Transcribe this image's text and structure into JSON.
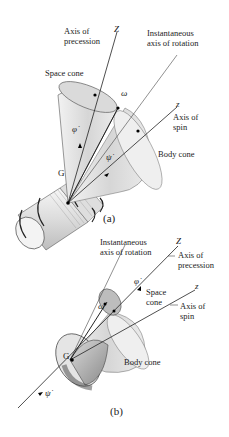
{
  "figure_a": {
    "caption": "(a)",
    "labels": {
      "axis_precession": "Axis of\nprecession",
      "axis_precession_l1": "Axis of",
      "axis_precession_l2": "precession",
      "Z": "Z",
      "inst_axis_l1": "Instantaneous",
      "inst_axis_l2": "axis of rotation",
      "space_cone": "Space cone",
      "omega": "ω",
      "z": "z",
      "axis_spin_l1": "Axis of",
      "axis_spin_l2": "spin",
      "phi_dot": "φ̇",
      "psi_dot": "ψ̇",
      "G": "G",
      "body_cone": "Body cone"
    }
  },
  "figure_b": {
    "caption": "(b)",
    "labels": {
      "inst_axis_l1": "Instantaneous",
      "inst_axis_l2": "axis of rotation",
      "Z": "Z",
      "axis_precession_l1": "Axis of",
      "axis_precession_l2": "precession",
      "phi_dot": "φ̇",
      "space_cone_l1": "Space",
      "space_cone_l2": "cone",
      "z": "z",
      "omega": "ω",
      "axis_spin_l1": "Axis of",
      "axis_spin_l2": "spin",
      "G": "G",
      "body_cone": "Body cone",
      "psi_dot": "ψ̇"
    }
  }
}
